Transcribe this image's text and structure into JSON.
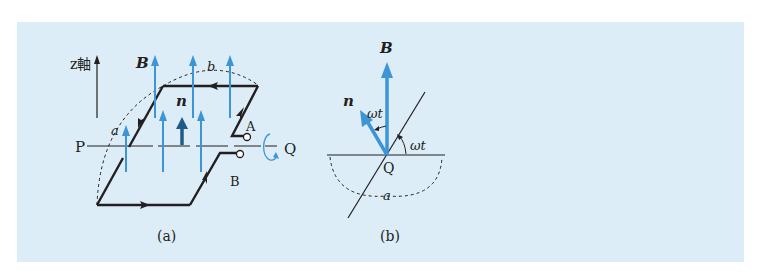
{
  "figure": {
    "background": "#dcedf8",
    "colors": {
      "field_arrow": "#3d95d6",
      "normal_arrow_a": "#1f5b85",
      "normal_arrow_b": "#3d95d6",
      "line": "#231f20"
    },
    "panel_a": {
      "caption": "(a)",
      "axis_label": "z軸",
      "left_point": "P",
      "right_point": "Q",
      "field_label": "B",
      "normal_label": "n",
      "side_a_label": "a",
      "side_b_label": "b",
      "terminal_a": "A",
      "terminal_b": "B",
      "rotation_icon": "rotation-arrow-icon"
    },
    "panel_b": {
      "caption": "(b)",
      "field_label": "B",
      "normal_label": "n",
      "angle_label_1": "ωt",
      "angle_label_2": "ωt",
      "center_label": "Q",
      "side_a_label": "a"
    }
  }
}
